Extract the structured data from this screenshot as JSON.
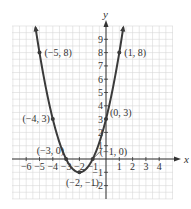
{
  "chart_data": {
    "type": "line",
    "title": "",
    "function": "y = (x+2)^2 - 1",
    "xlabel": "x",
    "ylabel": "y",
    "xlim": [
      -6.5,
      4.5
    ],
    "ylim": [
      -2.5,
      10
    ],
    "grid": true,
    "x_ticks": [
      -6,
      -5,
      -4,
      -3,
      -2,
      -1,
      1,
      2,
      3,
      4
    ],
    "y_ticks": [
      -2,
      -1,
      1,
      2,
      3,
      4,
      5,
      6,
      7,
      8,
      9
    ],
    "x_tick_labels": [
      "−6",
      "−5",
      "−4",
      "−3",
      "−2",
      "−1",
      "1",
      "2",
      "3",
      "4"
    ],
    "y_tick_labels": [
      "−2",
      "−1",
      "1",
      "2",
      "3",
      "4",
      "5",
      "6",
      "7",
      "8",
      "9"
    ],
    "points": [
      {
        "x": -5,
        "y": 8,
        "label": "(−5, 8)"
      },
      {
        "x": -4,
        "y": 3,
        "label": "(−4, 3)"
      },
      {
        "x": -3,
        "y": 0,
        "label": "(−3, 0)"
      },
      {
        "x": -2,
        "y": -1,
        "label": "(−2, −1)"
      },
      {
        "x": -1,
        "y": 0,
        "label": "(−1, 0)"
      },
      {
        "x": 0,
        "y": 3,
        "label": "(0, 3)"
      },
      {
        "x": 1,
        "y": 8,
        "label": "(1, 8)"
      }
    ],
    "curve_color": "#3a3a3a",
    "grid_color": "#d8d8d8"
  }
}
